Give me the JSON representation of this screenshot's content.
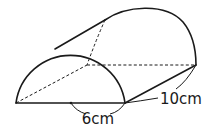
{
  "figure": {
    "type": "half-cylinder",
    "labels": {
      "diameter": "6cm",
      "length": "10cm"
    },
    "colors": {
      "stroke": "#1a1a1a",
      "background": "#ffffff"
    }
  }
}
